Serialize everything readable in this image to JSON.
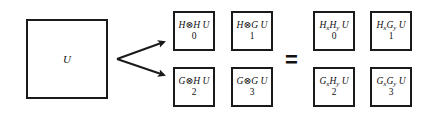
{
  "diagram": {
    "source": {
      "label": "U"
    },
    "arrow_targets": [
      "top-left block",
      "bottom-left block"
    ],
    "left_grid": [
      {
        "expr": "H⊗H U",
        "index": "0"
      },
      {
        "expr": "H⊗G U",
        "index": "1"
      },
      {
        "expr": "G⊗H U",
        "index": "2"
      },
      {
        "expr": "G⊗G U",
        "index": "3"
      }
    ],
    "equals": "=",
    "right_grid": [
      {
        "a": "H",
        "a_sub": "x",
        "b": "H",
        "b_sub": "y",
        "tail": " U",
        "index": "0"
      },
      {
        "a": "H",
        "a_sub": "x",
        "b": "G",
        "b_sub": "y",
        "tail": " U",
        "index": "1"
      },
      {
        "a": "G",
        "a_sub": "x",
        "b": "H",
        "b_sub": "y",
        "tail": " U",
        "index": "2"
      },
      {
        "a": "G",
        "a_sub": "x",
        "b": "G",
        "b_sub": "y",
        "tail": " U",
        "index": "3"
      }
    ],
    "colors": {
      "stroke": "#1a1a1a",
      "background": "#ffffff"
    }
  }
}
